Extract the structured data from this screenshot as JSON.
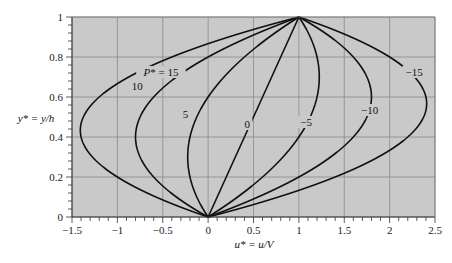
{
  "chart_data": {
    "type": "line",
    "title": "",
    "xlabel": "u* = u/V",
    "ylabel": "y* = y/h",
    "xlim": [
      -1.5,
      2.5
    ],
    "ylim": [
      0,
      1
    ],
    "grid": true,
    "legend": "inline curve labels",
    "x_ticks": [
      "-1.5",
      "-1",
      "-0.5",
      "0",
      "0.5",
      "1",
      "1.5",
      "2",
      "2.5"
    ],
    "y_ticks": [
      "0",
      "0.2",
      "0.4",
      "0.6",
      "0.8",
      "1"
    ],
    "formula": "u* = y* - (P*/2) y* (1 - y*)",
    "series": [
      {
        "name": "P* = 15",
        "P": 15,
        "label": "P* = 15",
        "label_pos": [
          -0.52,
          0.71
        ]
      },
      {
        "name": "10",
        "P": 10,
        "label": "10",
        "label_pos": [
          -0.78,
          0.64
        ]
      },
      {
        "name": "5",
        "P": 5,
        "label": "5",
        "label_pos": [
          -0.25,
          0.5
        ]
      },
      {
        "name": "0",
        "P": 0,
        "label": "0",
        "label_pos": [
          0.43,
          0.45
        ]
      },
      {
        "name": "-5",
        "P": -5,
        "label": "−5",
        "label_pos": [
          1.08,
          0.46
        ]
      },
      {
        "name": "-10",
        "P": -10,
        "label": "−10",
        "label_pos": [
          1.78,
          0.52
        ]
      },
      {
        "name": "-15",
        "P": -15,
        "label": "−15",
        "label_pos": [
          2.27,
          0.71
        ]
      }
    ]
  },
  "axes": {
    "xlabel": "u* = u/V",
    "ylabel": "y* = y/h"
  },
  "style": {
    "plot_bg": "#c9c9c9",
    "grid_color": "#8a8a8a",
    "curve_color": "#111111",
    "axis_color": "#333333"
  }
}
